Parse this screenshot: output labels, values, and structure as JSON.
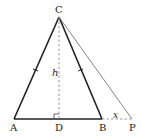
{
  "diagram": {
    "type": "geometry-figure",
    "points": {
      "A": {
        "label": "A",
        "x": 14,
        "y": 119
      },
      "B": {
        "label": "B",
        "x": 102,
        "y": 119
      },
      "C": {
        "label": "C",
        "x": 59,
        "y": 17
      },
      "D": {
        "label": "D",
        "x": 59,
        "y": 119
      },
      "P": {
        "label": "P",
        "x": 132,
        "y": 119
      }
    },
    "labels": {
      "height": "h",
      "extension": "x"
    },
    "colors": {
      "stroke": "#222222",
      "thin_stroke": "#666666",
      "dashed": "#999999"
    }
  }
}
